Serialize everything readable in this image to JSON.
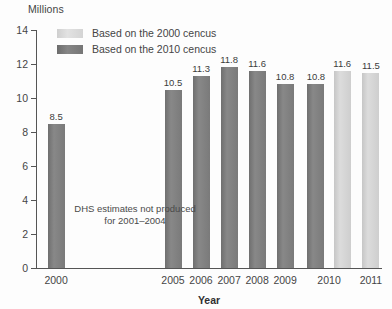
{
  "chart_data": {
    "type": "bar",
    "title": "",
    "subtitle": "",
    "ylabel": "Millions",
    "xlabel": "Year",
    "ylim": [
      0,
      14
    ],
    "ytick_step": 2,
    "yticks": [
      "0",
      "2",
      "4",
      "6",
      "8",
      "10",
      "12",
      "14"
    ],
    "grid": false,
    "legend_position": "top-left-inside",
    "categories": [
      "2000",
      "2005",
      "2006",
      "2007",
      "2008",
      "2009",
      "2010",
      "2011"
    ],
    "series": [
      {
        "name": "Based on the 2010 cencus",
        "color": "#7f7f7f",
        "values": [
          8.5,
          10.5,
          11.3,
          11.8,
          11.6,
          10.8,
          10.8,
          null
        ]
      },
      {
        "name": "Based on the 2000 cencus",
        "color": "#d4d4d4",
        "values": [
          null,
          null,
          null,
          null,
          null,
          null,
          11.6,
          11.5
        ]
      }
    ],
    "bars": [
      {
        "category": "2000",
        "value": 8.5,
        "label": "8.5",
        "series": "Based on the 2010 cencus",
        "shade": "dark",
        "x_center_pct": 5.8
      },
      {
        "category": "2005",
        "value": 10.5,
        "label": "10.5",
        "series": "Based on the 2010 cencus",
        "shade": "dark",
        "x_center_pct": 39.6
      },
      {
        "category": "2006",
        "value": 11.3,
        "label": "11.3",
        "series": "Based on the 2010 cencus",
        "shade": "dark",
        "x_center_pct": 47.7
      },
      {
        "category": "2007",
        "value": 11.8,
        "label": "11.8",
        "series": "Based on the 2010 cencus",
        "shade": "dark",
        "x_center_pct": 55.8
      },
      {
        "category": "2008",
        "value": 11.6,
        "label": "11.6",
        "series": "Based on the 2010 cencus",
        "shade": "dark",
        "x_center_pct": 63.9
      },
      {
        "category": "2009",
        "value": 10.8,
        "label": "10.8",
        "series": "Based on the 2010 cencus",
        "shade": "dark",
        "x_center_pct": 72.0
      },
      {
        "category": "2010",
        "value": 10.8,
        "label": "10.8",
        "series": "Based on the 2010 cencus",
        "shade": "dark",
        "x_center_pct": 80.9
      },
      {
        "category": "2010",
        "value": 11.6,
        "label": "11.6",
        "series": "Based on the 2000 cencus",
        "shade": "light",
        "x_center_pct": 88.5
      },
      {
        "category": "2011",
        "value": 11.5,
        "label": "11.5",
        "series": "Based on the 2000 cencus",
        "shade": "light",
        "x_center_pct": 96.8
      }
    ],
    "x_label_positions": [
      {
        "label": "2000",
        "x_center_pct": 5.8
      },
      {
        "label": "2005",
        "x_center_pct": 39.6
      },
      {
        "label": "2006",
        "x_center_pct": 47.7
      },
      {
        "label": "2007",
        "x_center_pct": 55.8
      },
      {
        "label": "2008",
        "x_center_pct": 63.9
      },
      {
        "label": "2009",
        "x_center_pct": 72.0
      },
      {
        "label": "2010",
        "x_center_pct": 84.7
      },
      {
        "label": "2011",
        "x_center_pct": 96.8
      }
    ],
    "annotations": [
      {
        "name": "no-data-note",
        "line1": "DHS estimates not produced",
        "line2": "for 2001–2004"
      }
    ]
  },
  "legend": {
    "items": [
      {
        "label": "Based on the 2000 cencus",
        "shade": "light"
      },
      {
        "label": "Based on the 2010 cencus",
        "shade": "dark"
      }
    ]
  },
  "colors": {
    "dark_bar": "#7f7f7f",
    "light_bar": "#d4d4d4",
    "axis": "#555555",
    "text": "#454545",
    "background": "#fdfdfd"
  }
}
